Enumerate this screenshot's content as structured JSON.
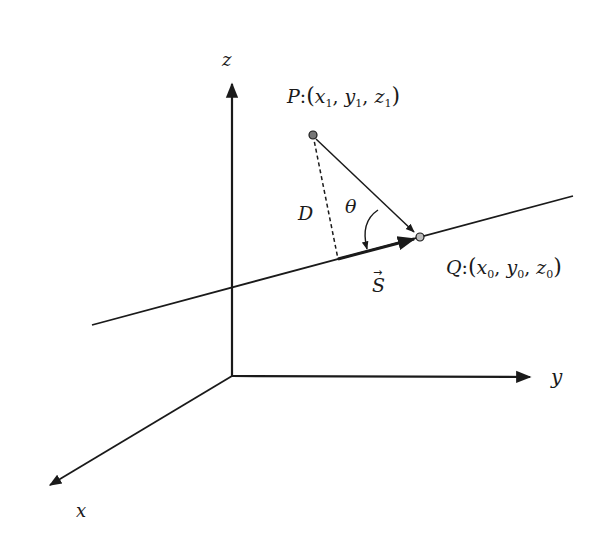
{
  "diagram": {
    "type": "3d-vector-geometry",
    "axes": {
      "z_label": "z",
      "y_label": "y",
      "x_label": "x"
    },
    "point_p": {
      "name": "P",
      "sep": ":",
      "coords": [
        "x",
        "y",
        "z"
      ],
      "subscript": "1"
    },
    "point_q": {
      "name": "Q",
      "sep": ":",
      "coords": [
        "x",
        "y",
        "z"
      ],
      "subscript": "0"
    },
    "distance_label": "D",
    "angle_label": "θ",
    "direction_vector_label": "S",
    "vector_bar": "→",
    "colors": {
      "ink": "#1a1a1a",
      "background": "#ffffff"
    }
  }
}
